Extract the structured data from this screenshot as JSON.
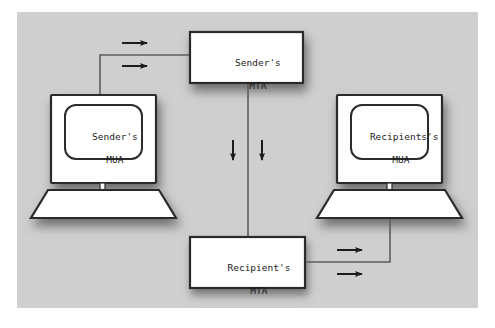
{
  "figure": {
    "background_color": "#ffffff",
    "panel_color": "#cfcfcf",
    "node_fill": "#ffffff",
    "stroke_color": "#2b2b2b",
    "connector_color": "#555555",
    "shadow_color": "#6e6e6e"
  },
  "nodes": {
    "sender_mta": {
      "label_line1": "Sender's",
      "label_line2": "MTA",
      "type": "box"
    },
    "recipient_mta": {
      "label_line1": "Recipient's",
      "label_line2": "MTA",
      "type": "box"
    },
    "sender_mua": {
      "label_line1": "Sender's",
      "label_line2": "MUA",
      "type": "computer"
    },
    "recipient_mua": {
      "label_line1": "Recipients's",
      "label_line2": "MUA",
      "type": "computer"
    }
  },
  "connectors": [
    {
      "name": "sender-mua-to-sender-mta",
      "from": "sender_mua",
      "to": "sender_mta",
      "arrow_glyphs": 2,
      "arrow_direction": "right"
    },
    {
      "name": "sender-mta-to-recipient-mta",
      "from": "sender_mta",
      "to": "recipient_mta",
      "arrow_glyphs": 2,
      "arrow_direction": "down"
    },
    {
      "name": "recipient-mta-to-recipient-mua",
      "from": "recipient_mta",
      "to": "recipient_mua",
      "arrow_glyphs": 2,
      "arrow_direction": "right"
    }
  ]
}
